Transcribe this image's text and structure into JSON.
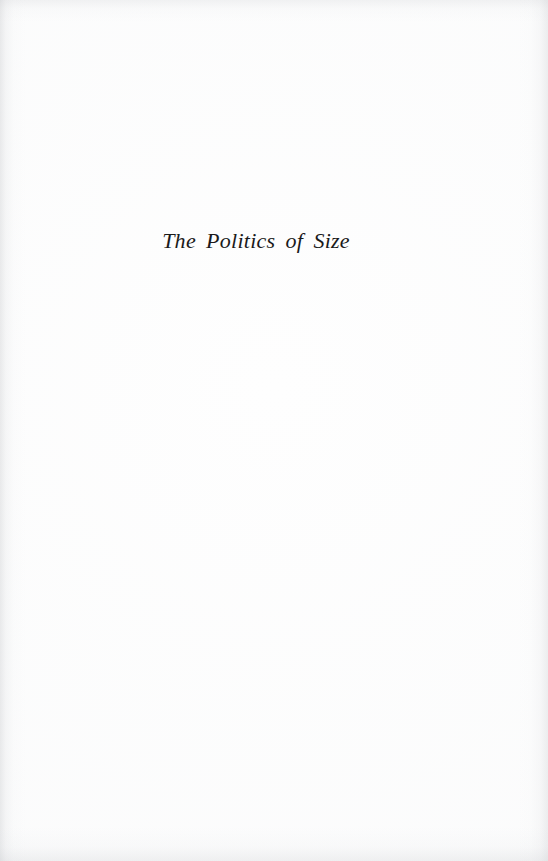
{
  "page": {
    "kind": "half-title-page",
    "background_color": "#fefefe",
    "ink_color": "#1a1a1a",
    "width": 548,
    "height": 861
  },
  "content": {
    "half_title": "The Politics of Size"
  },
  "scan_artifacts": {
    "left_edge_shadow": "",
    "right_edge_shadow": "",
    "top_edge_shadow": "",
    "bottom_edge_shadow": "",
    "paper_tone": ""
  }
}
